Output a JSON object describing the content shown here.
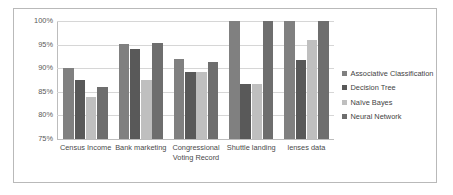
{
  "chart_data": {
    "type": "bar",
    "title": "",
    "subtitle": "",
    "xlabel": "",
    "ylabel": "",
    "grid": true,
    "legend_position": "right",
    "ylim": [
      75,
      100
    ],
    "ytick_labels": [
      "100%",
      "95%",
      "90%",
      "85%",
      "80%",
      "75%"
    ],
    "ytick_values": [
      100,
      95,
      90,
      85,
      80,
      75
    ],
    "categories": [
      "Census Income",
      "Bank marketing",
      "Congressional Voting Record",
      "Shuttle landing",
      "lenses data"
    ],
    "series": [
      {
        "name": "Associative Classification",
        "color": "#808080",
        "values": [
          90.0,
          95.1,
          91.9,
          100.0,
          100.0
        ]
      },
      {
        "name": "Decision Tree",
        "color": "#595959",
        "values": [
          87.5,
          94.1,
          89.3,
          86.7,
          91.7
        ]
      },
      {
        "name": "Naïve Bayes",
        "color": "#bfbfbf",
        "values": [
          83.9,
          87.5,
          89.3,
          86.7,
          96.0
        ]
      },
      {
        "name": "Neural Network",
        "color": "#6e6e6e",
        "values": [
          86.1,
          95.4,
          91.3,
          100.0,
          100.0
        ]
      }
    ]
  },
  "style": {
    "gridline_color": "#d6d6d6",
    "axis_color": "#bdbdbd",
    "border_color": "#b9b9b9",
    "text_color": "#595959"
  }
}
